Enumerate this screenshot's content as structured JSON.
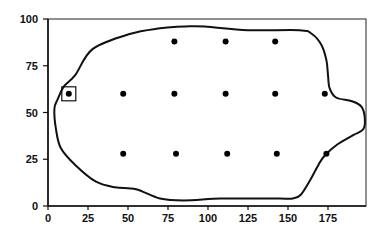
{
  "chart_data": {
    "type": "scatter",
    "title": "",
    "xlabel": "",
    "ylabel": "",
    "xlim": [
      0,
      200
    ],
    "ylim": [
      0,
      100
    ],
    "grid": false,
    "legend": null,
    "x_ticks": [
      "0",
      "25",
      "50",
      "75",
      "100",
      "125",
      "150",
      "175"
    ],
    "y_ticks": [
      "0",
      "25",
      "50",
      "75",
      "100"
    ],
    "series": [
      {
        "name": "points",
        "marker": "filled-circle",
        "points": [
          {
            "x": 13,
            "y": 60,
            "highlighted": true
          },
          {
            "x": 47,
            "y": 60
          },
          {
            "x": 79,
            "y": 60
          },
          {
            "x": 111,
            "y": 60
          },
          {
            "x": 142,
            "y": 60
          },
          {
            "x": 173,
            "y": 60
          },
          {
            "x": 79,
            "y": 88
          },
          {
            "x": 111,
            "y": 88
          },
          {
            "x": 142,
            "y": 88
          },
          {
            "x": 47,
            "y": 28
          },
          {
            "x": 80,
            "y": 28
          },
          {
            "x": 112,
            "y": 28
          },
          {
            "x": 143,
            "y": 28
          },
          {
            "x": 174,
            "y": 28
          }
        ]
      }
    ],
    "outline": {
      "description": "closed boundary curve enclosing the points",
      "points": [
        [
          17,
          70
        ],
        [
          28,
          84
        ],
        [
          51,
          92
        ],
        [
          70,
          95
        ],
        [
          86,
          96
        ],
        [
          98,
          96
        ],
        [
          125,
          94
        ],
        [
          157,
          94
        ],
        [
          165,
          92
        ],
        [
          171,
          86
        ],
        [
          174,
          78
        ],
        [
          175,
          70
        ],
        [
          176,
          63
        ],
        [
          180,
          58
        ],
        [
          190,
          56
        ],
        [
          196,
          53
        ],
        [
          198,
          47
        ],
        [
          197,
          41
        ],
        [
          191,
          38
        ],
        [
          181,
          33
        ],
        [
          173,
          27
        ],
        [
          169,
          22
        ],
        [
          164,
          14
        ],
        [
          158,
          6
        ],
        [
          153,
          4
        ],
        [
          145,
          4
        ],
        [
          132,
          4
        ],
        [
          108,
          4
        ],
        [
          85,
          3
        ],
        [
          70,
          4
        ],
        [
          55,
          9
        ],
        [
          42,
          10
        ],
        [
          30,
          13
        ],
        [
          17,
          22
        ],
        [
          8,
          31
        ],
        [
          5,
          41
        ],
        [
          4,
          52
        ],
        [
          6,
          57
        ],
        [
          10,
          64
        ]
      ]
    },
    "annotations": [
      {
        "type": "box",
        "around_point": {
          "x": 13,
          "y": 60
        }
      }
    ]
  }
}
